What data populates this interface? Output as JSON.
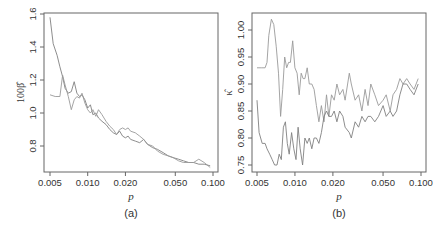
{
  "chart_data": [
    {
      "type": "line",
      "panel_label": "(a)",
      "title": "",
      "xlabel": "p",
      "ylabel": "100β̂",
      "xscale": "log",
      "xlim": [
        0.005,
        0.1
      ],
      "ylim": [
        0.62,
        1.6
      ],
      "xticks": [
        0.005,
        0.01,
        0.02,
        0.05,
        0.1
      ],
      "xtick_labels": [
        "0.005",
        "0.010",
        "0.020",
        "0.050",
        "0.100"
      ],
      "yticks": [
        0.8,
        1.0,
        1.2,
        1.4,
        1.6
      ],
      "ytick_labels": [
        "0.8",
        "1.0",
        "1.2",
        "1.4",
        "1.6"
      ],
      "grid": false,
      "legend": "none",
      "series": [
        {
          "name": "series 1",
          "color": "#808080",
          "x": [
            0.005,
            0.0053,
            0.0057,
            0.006,
            0.0063,
            0.0066,
            0.007,
            0.0074,
            0.0078,
            0.0082,
            0.0086,
            0.009,
            0.0095,
            0.01,
            0.0105,
            0.011,
            0.0116,
            0.0122,
            0.013,
            0.014,
            0.015,
            0.016,
            0.017,
            0.018,
            0.019,
            0.02,
            0.021,
            0.022,
            0.024,
            0.026,
            0.028,
            0.03,
            0.033,
            0.036,
            0.04,
            0.044,
            0.048,
            0.053,
            0.058,
            0.064,
            0.07,
            0.077,
            0.085,
            0.095
          ],
          "y": [
            1.58,
            1.42,
            1.35,
            1.28,
            1.22,
            1.15,
            1.12,
            1.13,
            1.19,
            1.12,
            1.1,
            1.11,
            1.08,
            1.03,
            1.05,
            0.99,
            1.0,
            0.97,
            0.95,
            0.93,
            0.9,
            0.88,
            0.87,
            0.89,
            0.86,
            0.85,
            0.86,
            0.84,
            0.83,
            0.82,
            0.84,
            0.81,
            0.79,
            0.78,
            0.76,
            0.74,
            0.73,
            0.72,
            0.71,
            0.7,
            0.7,
            0.69,
            0.69,
            0.68
          ]
        },
        {
          "name": "series 2",
          "color": "#9a9a9a",
          "x": [
            0.005,
            0.0055,
            0.006,
            0.0063,
            0.0066,
            0.007,
            0.0074,
            0.0078,
            0.0082,
            0.0086,
            0.009,
            0.0095,
            0.01,
            0.0105,
            0.011,
            0.0116,
            0.0122,
            0.013,
            0.014,
            0.015,
            0.016,
            0.017,
            0.018,
            0.019,
            0.02,
            0.021,
            0.022,
            0.024,
            0.026,
            0.028,
            0.03,
            0.033,
            0.036,
            0.04,
            0.044,
            0.048,
            0.053,
            0.058,
            0.064,
            0.07,
            0.077,
            0.085,
            0.095
          ],
          "y": [
            1.11,
            1.1,
            1.1,
            1.23,
            1.17,
            1.1,
            1.02,
            1.08,
            1.1,
            1.09,
            1.12,
            1.06,
            1.02,
            1.0,
            1.02,
            0.98,
            1.02,
            0.99,
            0.95,
            0.92,
            0.9,
            0.87,
            0.9,
            0.91,
            0.9,
            0.91,
            0.89,
            0.88,
            0.86,
            0.84,
            0.81,
            0.8,
            0.77,
            0.75,
            0.74,
            0.73,
            0.71,
            0.7,
            0.7,
            0.7,
            0.72,
            0.7,
            0.67
          ]
        }
      ]
    },
    {
      "type": "line",
      "panel_label": "(b)",
      "title": "",
      "xlabel": "p",
      "ylabel": "κ̂",
      "xscale": "log",
      "xlim": [
        0.005,
        0.1
      ],
      "ylim": [
        0.74,
        1.025
      ],
      "xticks": [
        0.005,
        0.01,
        0.02,
        0.05,
        0.1
      ],
      "xtick_labels": [
        "0.005",
        "0.010",
        "0.020",
        "0.050",
        "0.100"
      ],
      "yticks": [
        0.75,
        0.8,
        0.85,
        0.9,
        0.95,
        1.0
      ],
      "ytick_labels": [
        "0.75",
        "0.80",
        "0.85",
        "0.90",
        "0.95",
        "1.00"
      ],
      "grid": false,
      "legend": "none",
      "series": [
        {
          "name": "series 1",
          "color": "#9a9a9a",
          "x": [
            0.005,
            0.0054,
            0.0058,
            0.006,
            0.0062,
            0.0065,
            0.0068,
            0.0071,
            0.0074,
            0.0077,
            0.008,
            0.0083,
            0.0086,
            0.0089,
            0.0092,
            0.0096,
            0.01,
            0.0104,
            0.0108,
            0.0112,
            0.0116,
            0.012,
            0.0125,
            0.013,
            0.0136,
            0.0142,
            0.0148,
            0.0155,
            0.0162,
            0.017,
            0.0178,
            0.0186,
            0.0195,
            0.0205,
            0.0215,
            0.0226,
            0.024,
            0.025,
            0.027,
            0.028,
            0.03,
            0.032,
            0.034,
            0.036,
            0.038,
            0.04,
            0.043,
            0.046,
            0.05,
            0.053,
            0.057,
            0.06,
            0.064,
            0.068,
            0.072,
            0.077,
            0.082,
            0.088,
            0.095
          ],
          "y": [
            0.93,
            0.93,
            0.93,
            0.94,
            0.99,
            1.02,
            1.01,
            0.97,
            0.92,
            0.84,
            0.89,
            0.95,
            0.93,
            0.94,
            0.94,
            0.98,
            0.93,
            0.92,
            0.88,
            0.92,
            0.91,
            0.91,
            0.93,
            0.9,
            0.9,
            0.89,
            0.86,
            0.83,
            0.86,
            0.83,
            0.88,
            0.84,
            0.88,
            0.87,
            0.9,
            0.88,
            0.89,
            0.87,
            0.92,
            0.9,
            0.87,
            0.88,
            0.85,
            0.89,
            0.86,
            0.9,
            0.88,
            0.86,
            0.87,
            0.88,
            0.85,
            0.88,
            0.89,
            0.91,
            0.9,
            0.91,
            0.9,
            0.89,
            0.91
          ]
        },
        {
          "name": "series 2",
          "color": "#808080",
          "x": [
            0.005,
            0.0052,
            0.0055,
            0.0058,
            0.006,
            0.0063,
            0.0066,
            0.0069,
            0.0072,
            0.0075,
            0.0078,
            0.0081,
            0.0084,
            0.0087,
            0.009,
            0.0094,
            0.0098,
            0.0102,
            0.0106,
            0.011,
            0.0115,
            0.012,
            0.0125,
            0.013,
            0.0136,
            0.0142,
            0.0148,
            0.0155,
            0.0162,
            0.017,
            0.0178,
            0.0186,
            0.0195,
            0.0205,
            0.0215,
            0.0226,
            0.024,
            0.025,
            0.027,
            0.028,
            0.03,
            0.032,
            0.034,
            0.036,
            0.038,
            0.04,
            0.043,
            0.046,
            0.05,
            0.053,
            0.057,
            0.06,
            0.064,
            0.068,
            0.072,
            0.077,
            0.082,
            0.088,
            0.095
          ],
          "y": [
            0.87,
            0.81,
            0.79,
            0.79,
            0.78,
            0.77,
            0.76,
            0.75,
            0.75,
            0.77,
            0.76,
            0.82,
            0.83,
            0.79,
            0.77,
            0.81,
            0.78,
            0.76,
            0.82,
            0.78,
            0.75,
            0.8,
            0.79,
            0.8,
            0.78,
            0.8,
            0.8,
            0.79,
            0.81,
            0.84,
            0.85,
            0.84,
            0.84,
            0.85,
            0.83,
            0.85,
            0.84,
            0.82,
            0.81,
            0.8,
            0.83,
            0.82,
            0.84,
            0.83,
            0.84,
            0.84,
            0.83,
            0.84,
            0.86,
            0.84,
            0.85,
            0.84,
            0.85,
            0.88,
            0.9,
            0.9,
            0.89,
            0.88,
            0.9
          ]
        }
      ]
    }
  ],
  "panels": {
    "a": {
      "label": "(a)",
      "xlabel": "p",
      "ylabel": "100β̂"
    },
    "b": {
      "label": "(b)",
      "xlabel": "p",
      "ylabel": "κ̂"
    }
  }
}
